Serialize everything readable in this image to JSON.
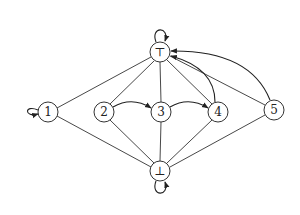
{
  "diagram": {
    "type": "lattice-graph",
    "nodes": [
      {
        "id": "top",
        "label": "⊤",
        "x": 160,
        "y": 52
      },
      {
        "id": "n1",
        "label": "1",
        "x": 48,
        "y": 112
      },
      {
        "id": "n2",
        "label": "2",
        "x": 104,
        "y": 112
      },
      {
        "id": "n3",
        "label": "3",
        "x": 161,
        "y": 112
      },
      {
        "id": "n4",
        "label": "4",
        "x": 218,
        "y": 112
      },
      {
        "id": "n5",
        "label": "5",
        "x": 274,
        "y": 110
      },
      {
        "id": "bot",
        "label": "⊥",
        "x": 160,
        "y": 171
      }
    ],
    "undirected_edges": [
      [
        "top",
        "n1"
      ],
      [
        "top",
        "n2"
      ],
      [
        "top",
        "n3"
      ],
      [
        "top",
        "n4"
      ],
      [
        "top",
        "n5"
      ],
      [
        "bot",
        "n1"
      ],
      [
        "bot",
        "n2"
      ],
      [
        "bot",
        "n3"
      ],
      [
        "bot",
        "n4"
      ],
      [
        "bot",
        "n5"
      ]
    ],
    "directed_arcs": [
      [
        "n2",
        "n3"
      ],
      [
        "n3",
        "n4"
      ],
      [
        "n4",
        "top"
      ],
      [
        "n5",
        "top"
      ]
    ],
    "self_loops": [
      "top",
      "n1",
      "bot"
    ]
  }
}
